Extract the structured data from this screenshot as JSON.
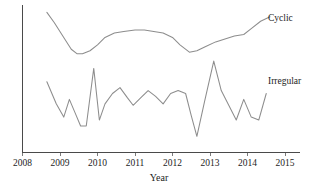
{
  "figure": {
    "background_color": "#ffffff",
    "line_color": "#8d8d8d",
    "axis_color": "#4a4a4a",
    "text_color": "#1c1c1c",
    "caption_fragment": ""
  },
  "axes": {
    "x_title": "Year",
    "x_tick_labels": [
      "2008",
      "2009",
      "2010",
      "2011",
      "2012",
      "2013",
      "2014",
      "2015"
    ],
    "y_tick_labels": []
  },
  "labels": {
    "cyclic": "Cyclic",
    "irregular": "Irregular"
  },
  "chart_data": {
    "type": "line",
    "title": "",
    "xlabel": "Year",
    "ylabel": "",
    "xlim": [
      2008,
      2015
    ],
    "ylim": [
      0,
      100
    ],
    "grid": false,
    "legend_position": "inline-right-end",
    "x_ticks": [
      2008,
      2009,
      2010,
      2011,
      2012,
      2013,
      2014,
      2015
    ],
    "y_ticks": [],
    "series": [
      {
        "name": "Cyclic",
        "color": "#8d8d8d",
        "x": [
          2008.65,
          2008.85,
          2009.1,
          2009.3,
          2009.45,
          2009.6,
          2009.8,
          2010.0,
          2010.2,
          2010.45,
          2010.7,
          2011.0,
          2011.25,
          2011.5,
          2011.75,
          2012.0,
          2012.2,
          2012.45,
          2012.65,
          2012.9,
          2013.15,
          2013.4,
          2013.65,
          2013.9,
          2014.1,
          2014.35,
          2014.6
        ],
        "y": [
          95,
          88,
          78,
          70,
          67,
          67,
          69,
          73,
          78,
          81,
          82,
          83,
          83,
          82,
          81,
          78,
          73,
          68,
          69,
          72,
          75,
          77,
          79,
          80,
          84,
          89,
          92
        ]
      },
      {
        "name": "Irregular",
        "color": "#8d8d8d",
        "x": [
          2008.65,
          2008.9,
          2009.1,
          2009.25,
          2009.4,
          2009.55,
          2009.7,
          2009.9,
          2010.05,
          2010.2,
          2010.4,
          2010.6,
          2010.8,
          2010.95,
          2011.15,
          2011.35,
          2011.55,
          2011.75,
          2011.95,
          2012.15,
          2012.35,
          2012.5,
          2012.65,
          2012.85,
          2013.1,
          2013.3,
          2013.5,
          2013.7,
          2013.9,
          2014.1,
          2014.3,
          2014.5
        ],
        "y": [
          48,
          33,
          24,
          36,
          27,
          18,
          18,
          57,
          22,
          33,
          40,
          44,
          37,
          32,
          37,
          42,
          38,
          33,
          40,
          42,
          40,
          25,
          11,
          34,
          62,
          42,
          32,
          22,
          36,
          24,
          22,
          40
        ]
      }
    ]
  }
}
